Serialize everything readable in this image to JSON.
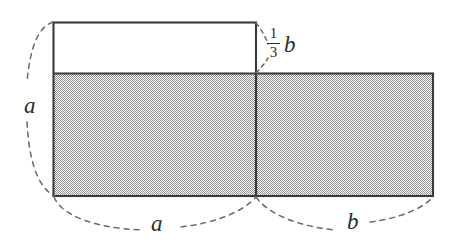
{
  "figure": {
    "type": "geometry-diagram",
    "background_color": "#ffffff",
    "stroke_color": "#3a3a3a",
    "shade_color": "#b5b5b5",
    "labels": {
      "left_height": "a",
      "bottom_left_width": "a",
      "bottom_right_width": "b",
      "top_strip": {
        "numerator": "1",
        "denominator": "3",
        "variable": "b"
      }
    },
    "shapes": {
      "white_strip": {
        "x": 53,
        "y": 22,
        "width": 203,
        "height": 51
      },
      "shaded_left": {
        "x": 53,
        "y": 73,
        "width": 203,
        "height": 123
      },
      "shaded_right": {
        "x": 256,
        "y": 73,
        "width": 177,
        "height": 123
      },
      "divider_x": 256
    },
    "braces": {
      "left_vertical": {
        "from_y": 22,
        "to_y": 196,
        "at_x": 53
      },
      "bottom_a": {
        "from_x": 53,
        "to_x": 256,
        "at_y": 196
      },
      "bottom_b": {
        "from_x": 256,
        "to_x": 433,
        "at_y": 196
      },
      "top_strip_leader": {
        "at_x": 256,
        "from_y": 22,
        "to_y": 73
      }
    }
  }
}
